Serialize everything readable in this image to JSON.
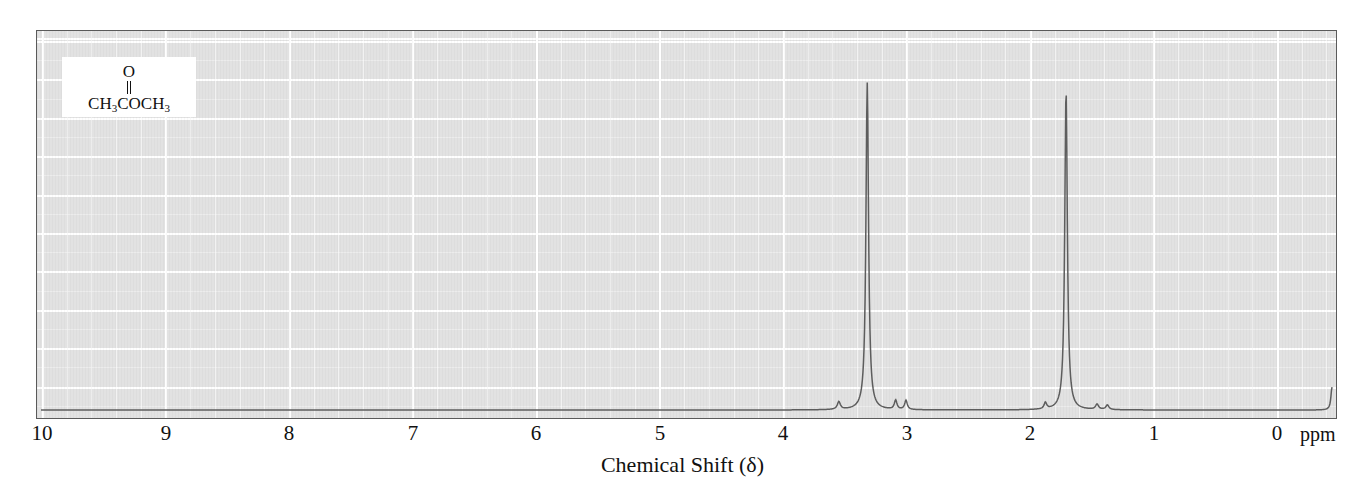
{
  "figure": {
    "name": "proton-nmr-spectrum",
    "axis_title": "Chemical Shift (δ)",
    "unit_label": "ppm",
    "background_color": "#e2e2e2",
    "grid_color": "#ffffff",
    "trace_color": "#555555",
    "frame_color": "#5a5a5a"
  },
  "structure": {
    "name": "acetone",
    "oxygen_label": "O",
    "formula_left": "CH",
    "formula_left_sub": "3",
    "formula_mid": "COCH",
    "formula_right_sub": "3",
    "bond_type": "double"
  },
  "axis": {
    "label": "Chemical Shift (δ)",
    "unit": "ppm",
    "direction": "reversed",
    "ticks": [
      {
        "value": 10,
        "label": "10",
        "x": 42
      },
      {
        "value": 9,
        "label": "9",
        "x": 166
      },
      {
        "value": 8,
        "label": "8",
        "x": 289
      },
      {
        "value": 7,
        "label": "7",
        "x": 413
      },
      {
        "value": 6,
        "label": "6",
        "x": 536
      },
      {
        "value": 5,
        "label": "5",
        "x": 660
      },
      {
        "value": 4,
        "label": "4",
        "x": 783
      },
      {
        "value": 3,
        "label": "3",
        "x": 907
      },
      {
        "value": 2,
        "label": "2",
        "x": 1030
      },
      {
        "value": 1,
        "label": "1",
        "x": 1154
      },
      {
        "value": 0,
        "label": "0",
        "x": 1277
      }
    ]
  },
  "chart_data": {
    "type": "line",
    "title": "",
    "subtitle": "",
    "xlabel": "Chemical Shift (δ)",
    "ylabel": "",
    "xlim": [
      10,
      0
    ],
    "ylim": [
      0,
      1
    ],
    "grid": true,
    "legend": "none",
    "annotation": "CH3COCH3",
    "x_unit": "ppm",
    "peaks": [
      {
        "name": "solvent-peak",
        "shift": 3.6,
        "height": 0.93,
        "width": 0.012,
        "label": ""
      },
      {
        "name": "acetone-methyl-peak",
        "shift": 2.06,
        "height": 0.91,
        "width": 0.012,
        "label": ""
      },
      {
        "name": "tms-reference-peak",
        "shift": 0.0,
        "height": 0.065,
        "width": 0.01,
        "label": "TMS"
      },
      {
        "name": "minor-peak-a",
        "shift": 3.82,
        "height": 0.022,
        "width": 0.014,
        "label": ""
      },
      {
        "name": "minor-peak-b",
        "shift": 3.38,
        "height": 0.026,
        "width": 0.012,
        "label": ""
      },
      {
        "name": "minor-peak-c",
        "shift": 3.3,
        "height": 0.026,
        "width": 0.012,
        "label": ""
      },
      {
        "name": "minor-peak-d",
        "shift": 2.22,
        "height": 0.018,
        "width": 0.012,
        "label": ""
      },
      {
        "name": "minor-peak-e",
        "shift": 1.82,
        "height": 0.015,
        "width": 0.014,
        "label": ""
      },
      {
        "name": "minor-peak-f",
        "shift": 1.74,
        "height": 0.013,
        "width": 0.014,
        "label": ""
      }
    ],
    "baseline": 0.0
  }
}
